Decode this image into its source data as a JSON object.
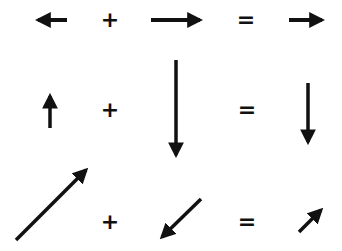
{
  "diagram": {
    "type": "vector-addition",
    "ink_color": "#111111",
    "background": "#ffffff",
    "rows": [
      {
        "name": "horizontal",
        "vector_a": {
          "direction": "left",
          "from": [
            67,
            20
          ],
          "to": [
            33,
            20
          ]
        },
        "operator_plus": "+",
        "vector_b": {
          "direction": "right",
          "from": [
            151,
            20
          ],
          "to": [
            206,
            20
          ]
        },
        "operator_equals": "=",
        "result": {
          "direction": "right",
          "from": [
            289,
            20
          ],
          "to": [
            328,
            20
          ]
        }
      },
      {
        "name": "vertical",
        "vector_a": {
          "direction": "up",
          "from": [
            50,
            128
          ],
          "to": [
            50,
            90
          ]
        },
        "operator_plus": "+",
        "vector_b": {
          "direction": "down",
          "from": [
            176,
            60
          ],
          "to": [
            176,
            161
          ]
        },
        "operator_equals": "=",
        "result": {
          "direction": "down",
          "from": [
            308,
            83
          ],
          "to": [
            308,
            148
          ]
        }
      },
      {
        "name": "diagonal",
        "vector_a": {
          "direction": "up-right",
          "from": [
            16,
            240
          ],
          "to": [
            90,
            166
          ]
        },
        "operator_plus": "+",
        "vector_b": {
          "direction": "down-left",
          "from": [
            201,
            199
          ],
          "to": [
            158,
            241
          ]
        },
        "operator_equals": "=",
        "result": {
          "direction": "up-right",
          "from": [
            299,
            232
          ],
          "to": [
            325,
            206
          ]
        }
      }
    ]
  }
}
